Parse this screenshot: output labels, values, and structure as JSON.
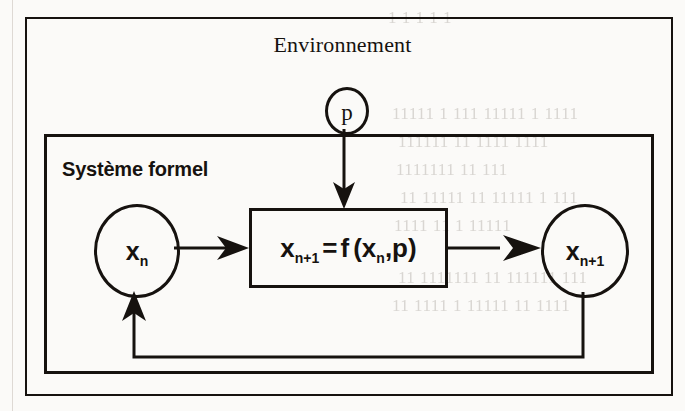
{
  "diagram": {
    "title": "Environnement",
    "subsystem_label": "Système formel",
    "nodes": {
      "parameter": {
        "label": "p",
        "shape": "circle"
      },
      "state_current": {
        "label": "x",
        "subscript": "n",
        "shape": "circle"
      },
      "state_next": {
        "label": "x",
        "subscript": "n+1",
        "shape": "circle"
      },
      "transition": {
        "lhs_var": "x",
        "lhs_sub": "n+1",
        "equals": "=",
        "fn": "f",
        "open_paren": "(",
        "arg_var": "x",
        "arg_sub": "n",
        "comma": ",",
        "arg2": "p",
        "close_paren": ")",
        "full_text": "x n+1 = f ( x n , p )",
        "shape": "rectangle"
      }
    },
    "edges": [
      {
        "name": "parameter-to-transition",
        "from": "parameter",
        "to": "transition",
        "direction": "down",
        "arrow": true
      },
      {
        "name": "state-current-to-transition",
        "from": "state_current",
        "to": "transition",
        "direction": "right",
        "arrow": true
      },
      {
        "name": "transition-to-state-next",
        "from": "transition",
        "to": "state_next",
        "direction": "right",
        "arrow": true
      },
      {
        "name": "feedback-loop",
        "from": "state_next",
        "to": "state_current",
        "direction": "loop-bottom",
        "arrow": true
      }
    ],
    "colors": {
      "ink": "#16120f",
      "paper": "#fbfaf8",
      "bleed_through": "#d9d6d2"
    }
  },
  "artifacts": {
    "bleed_lines": [
      "1 1 1 1 1",
      "11111 1 111 11111 1 1111",
      "111111 11 1111 1111",
      "1111111 11 111",
      "11 11111 11 11111 1 111",
      "1111 11 1 11111",
      "11 1111111 11 111111 111",
      "11 1111 1 11111 11 1111"
    ]
  }
}
